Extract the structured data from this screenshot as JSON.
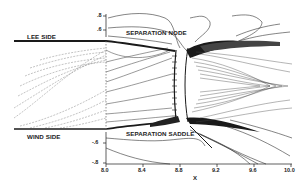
{
  "figure": {
    "type": "streamline-contour-plot",
    "regions": {
      "lee_side": "LEE SIDE",
      "wind_side": "WIND SIDE",
      "separation_node": "SEPARATION NODE",
      "separation_saddle": "SEPARATION SADDLE"
    },
    "x_axis": {
      "label": "X",
      "ticks": [
        "8.0",
        "8.4",
        "8.8",
        "9.2",
        "9.6",
        "10.0"
      ]
    },
    "y_axis": {
      "top_ticks": [
        ".8",
        ".6"
      ],
      "bottom_ticks": [
        "-.6",
        "-.8"
      ]
    },
    "colors": {
      "background": "#ffffff",
      "ink": "#1a1a1a",
      "faint_ink": "#777777"
    }
  }
}
